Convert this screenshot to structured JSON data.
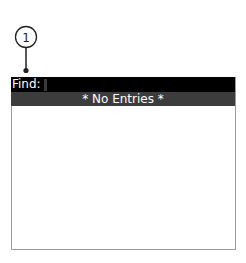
{
  "callout": {
    "number": "1"
  },
  "find_bar": {
    "label": "Find:",
    "value": ""
  },
  "list": {
    "empty_message": "* No Entries *"
  },
  "colors": {
    "find_bar_bg": "#000000",
    "entries_bar_bg": "#3c3c3c",
    "text": "#ffffff"
  }
}
